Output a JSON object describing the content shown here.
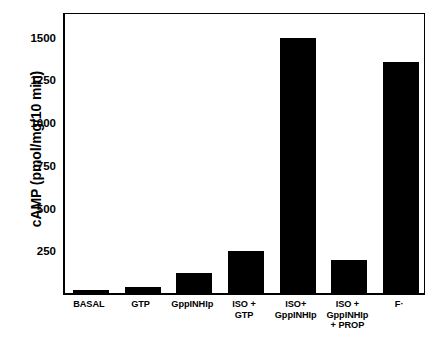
{
  "chart_data": {
    "type": "bar",
    "title": "",
    "xlabel": "",
    "ylabel": "cAMP (pmol/mg/10 min)",
    "categories": [
      "BASAL",
      "GTP",
      "GppINHIp",
      "ISO +\nGTP",
      "ISO+\nGppINHIp",
      "ISO +\nGppINHIp\n+ PROP",
      "F·"
    ],
    "values": [
      15,
      35,
      115,
      243,
      1490,
      196,
      1350
    ],
    "ylim": [
      0,
      1650
    ],
    "yticks": [
      250,
      500,
      750,
      1000,
      1250,
      1500
    ],
    "ytick_labels": [
      "250",
      "500",
      "750",
      "1000",
      "1250",
      "1500"
    ],
    "grid": false,
    "legend": false,
    "bar_color": "#000000",
    "axis_color": "#000000",
    "background": "#ffffff"
  }
}
